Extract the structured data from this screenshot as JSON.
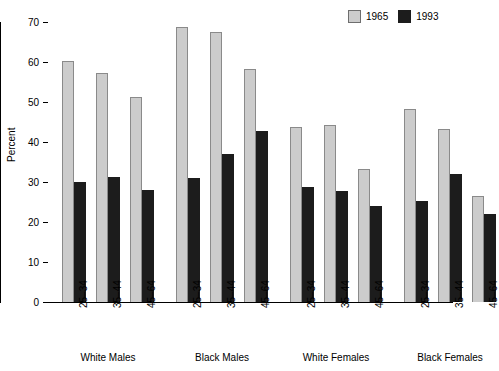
{
  "chart_data": {
    "type": "bar",
    "title": "",
    "subtitle": "",
    "xlabel": "",
    "ylabel": "Percent",
    "ylim": [
      0,
      70
    ],
    "yticks": [
      0,
      10,
      20,
      30,
      40,
      50,
      60,
      70
    ],
    "grid": false,
    "legend_position": "top-right",
    "groups": [
      "White Males",
      "Black Males",
      "White Females",
      "Black Females"
    ],
    "categories": [
      "25–34",
      "35–44",
      "45–64",
      "25–34",
      "35–44",
      "45–64",
      "25–34",
      "35–44",
      "45–64",
      "25–34",
      "35–44",
      "45–64"
    ],
    "series": [
      {
        "name": "1965",
        "color": "#cccccc",
        "values": [
          60.2,
          57.3,
          51.3,
          68.7,
          67.4,
          58.2,
          43.7,
          44.2,
          33.3,
          48.3,
          43.2,
          26.5
        ]
      },
      {
        "name": "1993",
        "color": "#1c1c1c",
        "values": [
          30.0,
          31.3,
          28.0,
          31.0,
          37.0,
          42.7,
          28.8,
          27.7,
          23.9,
          25.2,
          32.0,
          21.9
        ]
      }
    ]
  },
  "legend": {
    "entries": [
      {
        "label": "1965",
        "swatch": "light-gray-square"
      },
      {
        "label": "1993",
        "swatch": "black-square"
      }
    ]
  },
  "axes": {
    "y_title": "Percent",
    "y_tick_labels": [
      "0",
      "10",
      "20",
      "30",
      "40",
      "50",
      "60",
      "70"
    ]
  }
}
